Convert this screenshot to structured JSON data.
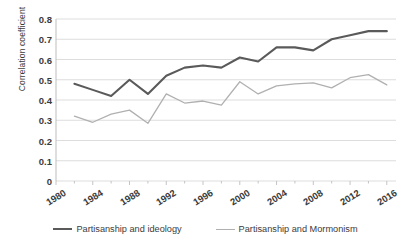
{
  "chart_data": {
    "type": "line",
    "title": "",
    "xlabel": "",
    "ylabel": "Correlation coefficient",
    "ylim": [
      0,
      0.8
    ],
    "xlim": [
      1980,
      2017
    ],
    "grid": true,
    "legend_position": "bottom",
    "y_ticks": [
      "0.8",
      "0.7",
      "0.6",
      "0.5",
      "0.4",
      "0.3",
      "0.2",
      "0.1",
      "0"
    ],
    "y_tick_values": [
      0.8,
      0.7,
      0.6,
      0.5,
      0.4,
      0.3,
      0.2,
      0.1,
      0
    ],
    "x_ticks": [
      "1980",
      "1984",
      "1988",
      "1992",
      "1996",
      "2000",
      "2004",
      "2008",
      "2012",
      "2016"
    ],
    "x_tick_values": [
      1980,
      1984,
      1988,
      1992,
      1996,
      2000,
      2004,
      2008,
      2012,
      2016
    ],
    "x": [
      1982,
      1984,
      1986,
      1988,
      1990,
      1992,
      1994,
      1996,
      1998,
      2000,
      2002,
      2004,
      2006,
      2008,
      2010,
      2012,
      2014,
      2016
    ],
    "series": [
      {
        "name": "Partisanship and ideology",
        "color": "#5a5a5a",
        "width": 2.1,
        "values": [
          0.48,
          0.45,
          0.42,
          0.5,
          0.43,
          0.52,
          0.56,
          0.57,
          0.56,
          0.61,
          0.59,
          0.66,
          0.66,
          0.645,
          0.7,
          0.72,
          0.74,
          0.74
        ]
      },
      {
        "name": "Partisanship and Mormonism",
        "color": "#b0b0b0",
        "width": 1.3,
        "values": [
          0.32,
          0.29,
          0.33,
          0.35,
          0.285,
          0.43,
          0.385,
          0.395,
          0.375,
          0.49,
          0.43,
          0.47,
          0.48,
          0.485,
          0.46,
          0.51,
          0.525,
          0.475
        ]
      }
    ]
  },
  "axes": {
    "y_title": "Correlation coefficient"
  },
  "legend": {
    "items": [
      {
        "label": "Partisanship and ideology",
        "style": "thick"
      },
      {
        "label": "Partisanship and Mormonism",
        "style": "thin"
      }
    ]
  }
}
